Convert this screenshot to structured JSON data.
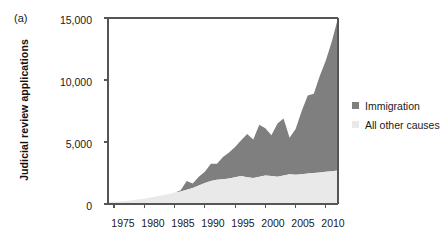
{
  "figure": {
    "panel_label": "(a)",
    "ylabel": "Judicial review applications"
  },
  "legend": {
    "position": "right",
    "entries": [
      {
        "label": "Immigration",
        "color": "#7f7f7f",
        "swatch_name": "legend-swatch-immigration"
      },
      {
        "label": "All other causes",
        "color": "#e9e9e9",
        "swatch_name": "legend-swatch-all-other-causes"
      }
    ]
  },
  "axes": {
    "y_ticks": [
      "0",
      "5,000",
      "10,000",
      "15,000"
    ],
    "y_tick_values": [
      0,
      5000,
      10000,
      15000
    ],
    "x_ticks": [
      "1975",
      "1980",
      "1985",
      "1990",
      "1995",
      "2000",
      "2005",
      "2010"
    ],
    "x_tick_values": [
      1975,
      1980,
      1985,
      1990,
      1995,
      2000,
      2005,
      2010
    ]
  },
  "chart_data": {
    "type": "area",
    "stacked": true,
    "title": "",
    "subtitle": "",
    "xlabel": "",
    "ylabel": "Judicial review applications",
    "xlim": [
      1974,
      2012
    ],
    "ylim": [
      0,
      15000
    ],
    "grid": false,
    "legend_position": "right",
    "annotations": [
      "(a)"
    ],
    "x": [
      1974,
      1975,
      1976,
      1977,
      1978,
      1979,
      1980,
      1981,
      1982,
      1983,
      1984,
      1985,
      1986,
      1987,
      1988,
      1989,
      1990,
      1991,
      1992,
      1993,
      1994,
      1995,
      1996,
      1997,
      1998,
      1999,
      2000,
      2001,
      2002,
      2003,
      2004,
      2005,
      2006,
      2007,
      2008,
      2009,
      2010,
      2011,
      2012
    ],
    "series": [
      {
        "name": "All other causes",
        "color": "#e9e9e9",
        "values": [
          160,
          180,
          210,
          250,
          300,
          360,
          430,
          520,
          600,
          700,
          800,
          900,
          1000,
          1150,
          1300,
          1500,
          1700,
          1850,
          1950,
          2000,
          2050,
          2150,
          2250,
          2150,
          2100,
          2200,
          2300,
          2250,
          2200,
          2300,
          2400,
          2350,
          2400,
          2450,
          2500,
          2550,
          2600,
          2650,
          2700
        ]
      },
      {
        "name": "Immigration",
        "color": "#7f7f7f",
        "values": [
          0,
          0,
          0,
          0,
          0,
          0,
          0,
          0,
          0,
          0,
          0,
          0,
          100,
          700,
          350,
          700,
          900,
          1400,
          1300,
          1800,
          2100,
          2450,
          2900,
          3500,
          3100,
          4200,
          3800,
          3300,
          4300,
          4600,
          2950,
          3700,
          5100,
          6300,
          6400,
          7800,
          9000,
          10500,
          12300
        ]
      }
    ],
    "totals": [
      160,
      180,
      210,
      250,
      300,
      360,
      430,
      520,
      600,
      700,
      800,
      900,
      1100,
      1850,
      1650,
      2200,
      2600,
      3250,
      3250,
      3800,
      4150,
      4600,
      5150,
      5650,
      5200,
      6400,
      6100,
      5550,
      6500,
      6900,
      5350,
      6050,
      7500,
      8750,
      8900,
      10350,
      11600,
      13150,
      15000
    ]
  }
}
